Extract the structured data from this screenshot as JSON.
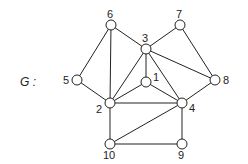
{
  "graph": {
    "name": "G",
    "name_label": "G :",
    "nodes": [
      {
        "id": "1",
        "x": 146,
        "y": 82,
        "lx": 153,
        "ly": 81
      },
      {
        "id": "2",
        "x": 110,
        "y": 103,
        "lx": 96,
        "ly": 113
      },
      {
        "id": "3",
        "x": 146,
        "y": 49,
        "lx": 142,
        "ly": 42
      },
      {
        "id": "4",
        "x": 182,
        "y": 103,
        "lx": 189,
        "ly": 112
      },
      {
        "id": "5",
        "x": 77,
        "y": 80,
        "lx": 63,
        "ly": 84
      },
      {
        "id": "6",
        "x": 111,
        "y": 25,
        "lx": 107,
        "ly": 18
      },
      {
        "id": "7",
        "x": 180,
        "y": 25,
        "lx": 176,
        "ly": 18
      },
      {
        "id": "8",
        "x": 215,
        "y": 80,
        "lx": 223,
        "ly": 84
      },
      {
        "id": "9",
        "x": 182,
        "y": 144,
        "lx": 178,
        "ly": 159
      },
      {
        "id": "10",
        "x": 110,
        "y": 144,
        "lx": 103,
        "ly": 159
      }
    ],
    "edges": [
      [
        "6",
        "5"
      ],
      [
        "6",
        "2"
      ],
      [
        "6",
        "3"
      ],
      [
        "7",
        "3"
      ],
      [
        "7",
        "8"
      ],
      [
        "3",
        "1"
      ],
      [
        "3",
        "2"
      ],
      [
        "3",
        "4"
      ],
      [
        "3",
        "8"
      ],
      [
        "5",
        "2"
      ],
      [
        "1",
        "2"
      ],
      [
        "1",
        "4"
      ],
      [
        "2",
        "4"
      ],
      [
        "2",
        "10"
      ],
      [
        "8",
        "4"
      ],
      [
        "4",
        "10"
      ],
      [
        "4",
        "9"
      ],
      [
        "10",
        "9"
      ]
    ]
  }
}
